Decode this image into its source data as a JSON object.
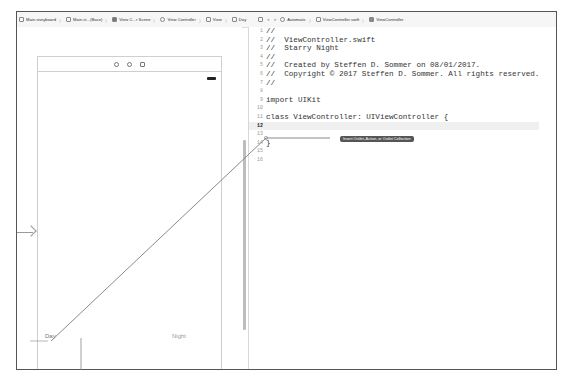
{
  "jumpbar": {
    "items": [
      {
        "icon": "storyboard-icon",
        "label": "Main.storyboard"
      },
      {
        "icon": "file-icon",
        "label": "Main.st...(Base)"
      },
      {
        "icon": "scene-icon",
        "label": "View C...r Scene"
      },
      {
        "icon": "view-controller-icon",
        "label": "View Controller"
      },
      {
        "icon": "view-icon",
        "label": "View"
      },
      {
        "icon": "label-icon",
        "label": "Day"
      }
    ],
    "assistant": {
      "grid_icon": "grid-icon",
      "back": "<",
      "forward": ">",
      "mode": "Automatic",
      "file": "ViewController.swift",
      "symbol": "ViewController"
    }
  },
  "scene": {
    "header_icons": [
      "view-controller-icon",
      "first-responder-icon",
      "exit-icon"
    ],
    "labels": {
      "day": "Day",
      "night": "Night"
    }
  },
  "code": {
    "lines": [
      {
        "n": "1",
        "t": "//"
      },
      {
        "n": "2",
        "t": "//  ViewController.swift"
      },
      {
        "n": "3",
        "t": "//  Starry Night"
      },
      {
        "n": "4",
        "t": "//"
      },
      {
        "n": "5",
        "t": "//  Created by Steffen D. Sommer on 08/01/2017."
      },
      {
        "n": "6",
        "t": "//  Copyright © 2017 Steffen D. Sommer. All rights reserved."
      },
      {
        "n": "7",
        "t": "//"
      },
      {
        "n": "8",
        "t": ""
      },
      {
        "n": "9",
        "t": "import UIKit"
      },
      {
        "n": "10",
        "t": ""
      },
      {
        "n": "11",
        "t": "class ViewController: UIViewController {"
      },
      {
        "n": "12",
        "t": ""
      },
      {
        "n": "13",
        "t": ""
      },
      {
        "n": "14",
        "t": "}"
      },
      {
        "n": "15",
        "t": ""
      },
      {
        "n": "16",
        "t": ""
      }
    ],
    "highlighted_line": "12"
  },
  "tooltip": "Insert Outlet, Action, or Outlet Collection"
}
